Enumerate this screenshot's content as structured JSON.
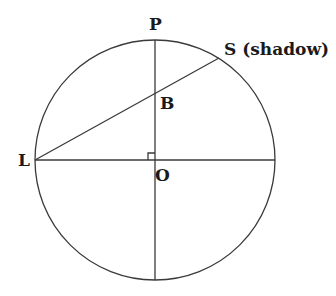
{
  "diagram": {
    "type": "geometry",
    "circle": {
      "cx": 155,
      "cy": 160,
      "r": 120
    },
    "points": {
      "P": {
        "label": "P",
        "x": 155,
        "y": 40
      },
      "S": {
        "label": "S (shadow)",
        "x": 219,
        "y": 58
      },
      "B": {
        "label": "B",
        "x": 155,
        "y": 93
      },
      "L": {
        "label": "L",
        "x": 35,
        "y": 160
      },
      "O": {
        "label": "O",
        "x": 155,
        "y": 160
      }
    },
    "segments": [
      {
        "from": "L",
        "to": "S",
        "name": "line-LS"
      },
      {
        "from": "P",
        "to": "bottom",
        "name": "vertical-diameter"
      },
      {
        "from": "L",
        "to": "right",
        "name": "horizontal-diameter"
      }
    ],
    "right_angle_marker_at": "O",
    "stroke_color": "#3a3a3a",
    "label_color": "#1a1a1a"
  }
}
